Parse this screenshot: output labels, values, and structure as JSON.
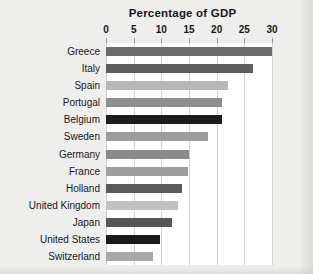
{
  "chart_data": {
    "type": "bar",
    "orientation": "horizontal",
    "title": "Percentage of GDP",
    "xlabel": "",
    "ylabel": "",
    "xlim": [
      0,
      30
    ],
    "xticks": [
      0,
      5,
      10,
      15,
      20,
      25,
      30
    ],
    "xtick_labels": [
      "0",
      "5",
      "10",
      "15",
      "20",
      "25",
      "30"
    ],
    "grid": "vertical",
    "legend": "none",
    "categories": [
      "Greece",
      "Italy",
      "Spain",
      "Portugal",
      "Belgium",
      "Sweden",
      "Germany",
      "France",
      "Holland",
      "United Kingdom",
      "Japan",
      "United States",
      "Switzerland"
    ],
    "values": [
      30,
      26.5,
      22,
      21,
      21,
      18.5,
      15,
      14.8,
      13.7,
      13,
      12,
      9.8,
      8.5
    ],
    "bar_colors": [
      "#6b6b6b",
      "#5e5e5e",
      "#b8b8b8",
      "#8f8f8f",
      "#1c1c1c",
      "#9c9c9c",
      "#8a8a8a",
      "#9e9e9e",
      "#5a5a5a",
      "#c2c2c2",
      "#555555",
      "#1a1a1a",
      "#a8a8a8"
    ],
    "plot_background": "#ffffff",
    "page_background": "#eeeeec",
    "gridline_color": "#d2d2d0"
  }
}
